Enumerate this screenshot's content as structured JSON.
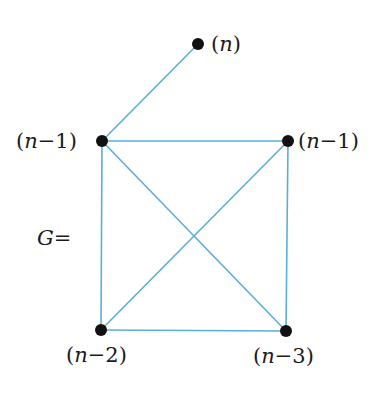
{
  "diagram": {
    "graph_label": "G=",
    "edge_color": "#5aaedc",
    "node_color": "#111111",
    "nodes": [
      {
        "id": "v1",
        "label": "(n)",
        "var": "n",
        "suffix": "",
        "x": 198,
        "y": 44
      },
      {
        "id": "v2",
        "label": "(n-1)",
        "var": "n",
        "suffix": "−1",
        "x": 102,
        "y": 141
      },
      {
        "id": "v3",
        "label": "(n-1)",
        "var": "n",
        "suffix": "−1",
        "x": 288,
        "y": 141
      },
      {
        "id": "v4",
        "label": "(n-2)",
        "var": "n",
        "suffix": "−2",
        "x": 101,
        "y": 330
      },
      {
        "id": "v5",
        "label": "(n-3)",
        "var": "n",
        "suffix": "−3",
        "x": 286,
        "y": 331
      }
    ],
    "edges": [
      [
        "v1",
        "v2"
      ],
      [
        "v2",
        "v3"
      ],
      [
        "v2",
        "v4"
      ],
      [
        "v2",
        "v5"
      ],
      [
        "v3",
        "v4"
      ],
      [
        "v3",
        "v5"
      ],
      [
        "v4",
        "v5"
      ]
    ]
  }
}
